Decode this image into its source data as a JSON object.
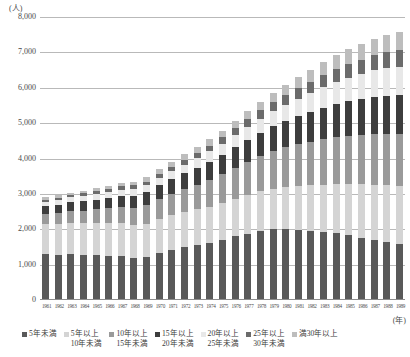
{
  "chart_data": {
    "type": "bar",
    "subtype": "stacked-bar",
    "title": "",
    "unit_label": "(人)",
    "xlabel": "(年)",
    "ylabel": "",
    "ylim": [
      0,
      8000
    ],
    "yticks": [
      "8,000",
      "7,000",
      "6,000",
      "5,000",
      "4,000",
      "3,000",
      "2,000",
      "1,000",
      "0"
    ],
    "ytick_values": [
      8000,
      7000,
      6000,
      5000,
      4000,
      3000,
      2000,
      1000,
      0
    ],
    "grid": true,
    "legend_position": "bottom",
    "categories": [
      "1961",
      "1962",
      "1963",
      "1964",
      "1965",
      "1966",
      "1967",
      "1968",
      "1969",
      "1970",
      "1971",
      "1972",
      "1973",
      "1974",
      "1975",
      "1976",
      "1977",
      "1978",
      "1979",
      "1980",
      "1981",
      "1982",
      "1983",
      "1984",
      "1985",
      "1986",
      "1987",
      "1988",
      "1989"
    ],
    "series": [
      {
        "name": "5年未満",
        "color": "#595959",
        "values": [
          1300,
          1280,
          1290,
          1270,
          1260,
          1250,
          1240,
          1190,
          1210,
          1330,
          1420,
          1500,
          1560,
          1620,
          1700,
          1800,
          1880,
          1950,
          2000,
          2010,
          1990,
          1960,
          1930,
          1890,
          1830,
          1760,
          1700,
          1640,
          1580
        ]
      },
      {
        "name": "5年以上10年未満",
        "color": "#d4d4d4",
        "values": [
          860,
          880,
          890,
          900,
          910,
          920,
          930,
          940,
          950,
          960,
          970,
          980,
          1000,
          1020,
          1040,
          1060,
          1090,
          1120,
          1150,
          1190,
          1230,
          1280,
          1330,
          1390,
          1450,
          1510,
          1560,
          1600,
          1630
        ]
      },
      {
        "name": "10年以上15年未満",
        "color": "#9a9a9a",
        "values": [
          280,
          300,
          330,
          360,
          390,
          420,
          450,
          480,
          520,
          560,
          600,
          650,
          700,
          760,
          820,
          880,
          940,
          1000,
          1060,
          1120,
          1180,
          1240,
          1290,
          1330,
          1370,
          1400,
          1430,
          1450,
          1470
        ]
      },
      {
        "name": "15年以上20年未満",
        "color": "#3d3d3d",
        "values": [
          220,
          240,
          250,
          260,
          280,
          300,
          320,
          340,
          360,
          390,
          420,
          450,
          480,
          510,
          540,
          580,
          620,
          660,
          700,
          740,
          790,
          840,
          890,
          940,
          980,
          1020,
          1060,
          1090,
          1110
        ]
      },
      {
        "name": "20年以上25年未満",
        "color": "#e8e8e8",
        "values": [
          120,
          130,
          140,
          150,
          160,
          170,
          180,
          190,
          200,
          215,
          230,
          250,
          270,
          290,
          315,
          340,
          370,
          400,
          430,
          460,
          500,
          540,
          580,
          620,
          660,
          700,
          740,
          780,
          810
        ]
      },
      {
        "name": "25年以上30年未満",
        "color": "#6b6b6b",
        "values": [
          60,
          65,
          70,
          75,
          80,
          88,
          95,
          102,
          110,
          120,
          130,
          142,
          155,
          168,
          182,
          198,
          215,
          232,
          250,
          270,
          292,
          315,
          338,
          362,
          385,
          408,
          430,
          450,
          468
        ]
      },
      {
        "name": "満30年以上",
        "color": "#bdbdbd",
        "values": [
          60,
          65,
          70,
          75,
          82,
          90,
          98,
          106,
          115,
          125,
          136,
          148,
          162,
          176,
          192,
          210,
          228,
          248,
          268,
          290,
          314,
          338,
          362,
          388,
          414,
          440,
          466,
          490,
          512
        ]
      }
    ]
  },
  "legend": [
    {
      "line1": "5年未満",
      "line2": "",
      "color": "#595959"
    },
    {
      "line1": "5年以上",
      "line2": "10年未満",
      "color": "#d4d4d4"
    },
    {
      "line1": "10年以上",
      "line2": "15年未満",
      "color": "#9a9a9a"
    },
    {
      "line1": "15年以上",
      "line2": "20年未満",
      "color": "#3d3d3d"
    },
    {
      "line1": "20年以上",
      "line2": "25年未満",
      "color": "#e8e8e8"
    },
    {
      "line1": "25年以上",
      "line2": "30年未満",
      "color": "#6b6b6b"
    },
    {
      "line1": "満30年以上",
      "line2": "",
      "color": "#bdbdbd"
    }
  ]
}
